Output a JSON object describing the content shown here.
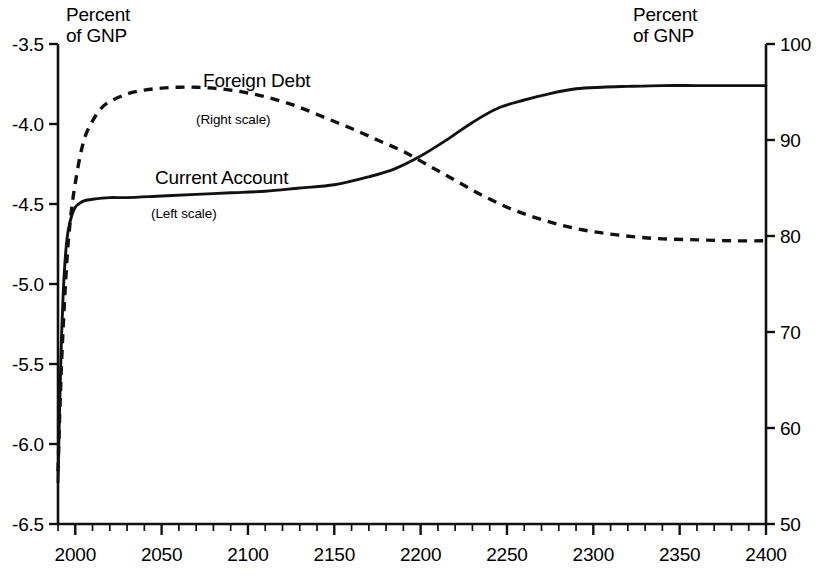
{
  "chart_data": {
    "type": "line",
    "title": "",
    "xlabel": "",
    "left_axis_unit_label": "Percent\nof GNP",
    "right_axis_unit_label": "Percent\nof GNP",
    "xlim": [
      1990,
      2400
    ],
    "x_ticks": [
      2000,
      2050,
      2100,
      2150,
      2200,
      2250,
      2300,
      2350,
      2400
    ],
    "x_tick_labels": [
      "2000",
      "2050",
      "2100",
      "2150",
      "2200",
      "2250",
      "2300",
      "2350",
      "2400"
    ],
    "x_minor_tick_step": 10,
    "left_ylim": [
      -6.5,
      -3.5
    ],
    "left_y_ticks": [
      -3.5,
      -4.0,
      -4.5,
      -5.0,
      -5.5,
      -6.0,
      -6.5
    ],
    "left_y_tick_labels": [
      "-3.5",
      "-4.0",
      "-4.5",
      "-5.0",
      "-5.5",
      "-6.0",
      "-6.5"
    ],
    "right_ylim": [
      50,
      100
    ],
    "right_y_ticks": [
      100,
      90,
      80,
      70,
      60,
      50
    ],
    "right_y_tick_labels": [
      "100",
      "90",
      "80",
      "70",
      "60",
      "50"
    ],
    "grid": false,
    "legend_position": "inline-annotation",
    "series": [
      {
        "name": "Current Account",
        "scale_note": "(Left scale)",
        "axis": "left",
        "style": "solid",
        "ylabel": "Percent of GNP",
        "x": [
          1990,
          1991,
          1992,
          1993,
          1994,
          1995,
          1996,
          1998,
          2000,
          2002,
          2005,
          2010,
          2020,
          2030,
          2050,
          2070,
          2090,
          2110,
          2130,
          2150,
          2170,
          2185,
          2200,
          2215,
          2230,
          2245,
          2260,
          2275,
          2290,
          2305,
          2320,
          2340,
          2360,
          2380,
          2400
        ],
        "values": [
          -6.24,
          -5.74,
          -5.34,
          -5.06,
          -4.87,
          -4.74,
          -4.66,
          -4.57,
          -4.52,
          -4.5,
          -4.48,
          -4.47,
          -4.46,
          -4.46,
          -4.45,
          -4.44,
          -4.43,
          -4.42,
          -4.4,
          -4.38,
          -4.33,
          -4.28,
          -4.2,
          -4.1,
          -3.99,
          -3.9,
          -3.85,
          -3.81,
          -3.78,
          -3.77,
          -3.765,
          -3.76,
          -3.76,
          -3.76,
          -3.76
        ]
      },
      {
        "name": "Foreign Debt",
        "scale_note": "(Right scale)",
        "axis": "right",
        "style": "dashed",
        "ylabel": "Percent of GNP",
        "x": [
          1990,
          1991,
          1992,
          1993,
          1994,
          1995,
          1996,
          1998,
          2000,
          2003,
          2006,
          2010,
          2015,
          2020,
          2030,
          2040,
          2050,
          2060,
          2070,
          2080,
          2090,
          2100,
          2110,
          2120,
          2130,
          2145,
          2160,
          2175,
          2190,
          2205,
          2220,
          2235,
          2250,
          2265,
          2280,
          2295,
          2310,
          2325,
          2340,
          2360,
          2380,
          2400
        ],
        "values": [
          55.5,
          61.5,
          66.5,
          70.5,
          74.0,
          77.0,
          79.5,
          83.0,
          85.5,
          88.5,
          90.5,
          92.0,
          93.3,
          94.0,
          94.8,
          95.2,
          95.4,
          95.5,
          95.5,
          95.4,
          95.2,
          94.9,
          94.5,
          94.0,
          93.4,
          92.3,
          91.2,
          90.0,
          88.8,
          87.3,
          85.8,
          84.3,
          83.0,
          82.0,
          81.2,
          80.6,
          80.2,
          79.9,
          79.7,
          79.6,
          79.5,
          79.5
        ]
      }
    ],
    "crossing_point": {
      "x": 2222,
      "left_value": -4.14,
      "right_value": 89.0
    },
    "colors": {
      "line": "#111111",
      "background": "#ffffff",
      "text": "#000000"
    }
  },
  "labels": {
    "foreign_debt": "Foreign Debt",
    "foreign_debt_scale": "(Right scale)",
    "current_account": "Current Account",
    "current_account_scale": "(Left scale)",
    "unit_left": "Percent\nof GNP",
    "unit_right": "Percent\nof GNP"
  }
}
